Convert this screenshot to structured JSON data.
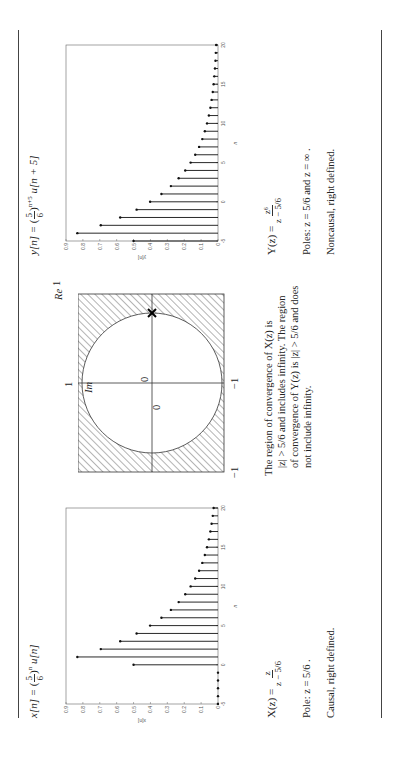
{
  "left": {
    "title": "x[n] = (5/6)^n u[n]",
    "title_parts": {
      "lhs": "x[n] =",
      "base_num": "5",
      "base_den": "6",
      "exp": "n",
      "tail": "u[n]"
    },
    "transform": {
      "lhs": "X(z) =",
      "num": "z",
      "den": "z − 5/6"
    },
    "pole": "Pole: z = 5/6 .",
    "note": "Causal, right defined."
  },
  "middle": {
    "labels": {
      "re": "Re",
      "im": "Im",
      "one_right": "1",
      "one_top": "1",
      "minus_one_left": "−1",
      "minus_one_bottom": "−1",
      "zero_a": "0",
      "zero_b": "0"
    },
    "caption": [
      "The region of convergence of X(z) is",
      "|z| > 5/6 and includes infinity. The region",
      "of convergence of Y(z) is |z| > 5/6 and does",
      "not include infinity."
    ]
  },
  "right": {
    "title": "y[n] = (5/6)^(n+5) u[n+5]",
    "title_parts": {
      "lhs": "y[n] =",
      "base_num": "5",
      "base_den": "6",
      "exp": "n+5",
      "tail": "u[n + 5]"
    },
    "transform": {
      "lhs": "Y(z) =",
      "num": "z⁶",
      "den": "z − 5/6"
    },
    "poles": "Poles: z = 5/6 and z = ∞ .",
    "note": "Noncausal, right defined."
  },
  "chart_data": [
    {
      "type": "stem",
      "title": "x[n]",
      "xlabel": "n",
      "ylabel": "x[n]",
      "xlim": [
        -5,
        20
      ],
      "ylim": [
        0,
        0.9
      ],
      "xticks": [
        -5,
        0,
        5,
        10,
        15,
        20
      ],
      "yticks": [
        0,
        0.1,
        0.2,
        0.3,
        0.4,
        0.5,
        0.6,
        0.7,
        0.8,
        0.9
      ],
      "x": [
        -5,
        -4,
        -3,
        -2,
        -1,
        0,
        1,
        2,
        3,
        4,
        5,
        6,
        7,
        8,
        9,
        10,
        11,
        12,
        13,
        14,
        15,
        16,
        17,
        18,
        19,
        20
      ],
      "values": [
        0,
        0,
        0,
        0,
        0,
        0.5,
        0.833,
        0.694,
        0.579,
        0.482,
        0.402,
        0.335,
        0.279,
        0.233,
        0.194,
        0.162,
        0.135,
        0.112,
        0.093,
        0.078,
        0.065,
        0.054,
        0.045,
        0.038,
        0.031,
        0.026
      ]
    },
    {
      "type": "stem",
      "title": "y[n]",
      "xlabel": "n",
      "ylabel": "y[n]",
      "xlim": [
        -5,
        20
      ],
      "ylim": [
        0,
        0.9
      ],
      "xticks": [
        -5,
        0,
        5,
        10,
        15,
        20
      ],
      "yticks": [
        0,
        0.1,
        0.2,
        0.3,
        0.4,
        0.5,
        0.6,
        0.7,
        0.8,
        0.9
      ],
      "x": [
        -5,
        -4,
        -3,
        -2,
        -1,
        0,
        1,
        2,
        3,
        4,
        5,
        6,
        7,
        8,
        9,
        10,
        11,
        12,
        13,
        14,
        15,
        16,
        17,
        18,
        19,
        20
      ],
      "values": [
        0.5,
        0.833,
        0.694,
        0.579,
        0.482,
        0.402,
        0.335,
        0.279,
        0.233,
        0.194,
        0.162,
        0.135,
        0.112,
        0.093,
        0.078,
        0.065,
        0.054,
        0.045,
        0.038,
        0.031,
        0.026,
        0.022,
        0.018,
        0.015,
        0.013,
        0.011
      ]
    }
  ]
}
